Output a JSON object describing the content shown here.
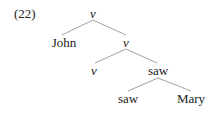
{
  "example_number": "(22)",
  "tree": {
    "root": {
      "label": "v",
      "italic": true
    },
    "nodes": [
      {
        "id": "john",
        "label": "John",
        "italic": false
      },
      {
        "id": "v1",
        "label": "v",
        "italic": true
      },
      {
        "id": "v2",
        "label": "v",
        "italic": true
      },
      {
        "id": "saw1",
        "label": "saw",
        "italic": false
      },
      {
        "id": "saw2",
        "label": "saw",
        "italic": false
      },
      {
        "id": "mary",
        "label": "Mary",
        "italic": false
      }
    ],
    "edges": [
      [
        "root",
        "john"
      ],
      [
        "root",
        "v1"
      ],
      [
        "v1",
        "v2"
      ],
      [
        "v1",
        "saw1"
      ],
      [
        "saw1",
        "saw2"
      ],
      [
        "saw1",
        "mary"
      ]
    ]
  },
  "colors": {
    "text": "#222222",
    "edge": "#8a8a8a",
    "background": "#ffffff"
  }
}
